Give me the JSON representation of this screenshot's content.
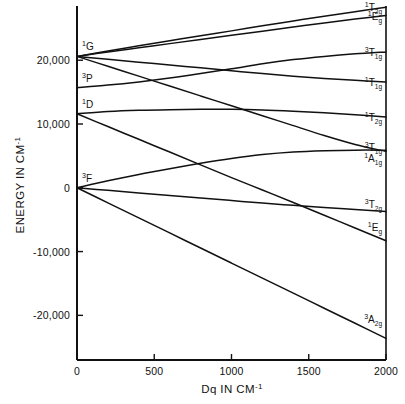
{
  "figure": {
    "kind": "energy-level-correlation-diagram",
    "background": "#ffffff",
    "line_color": "#111111"
  },
  "axes": {
    "x_title": "Dq IN CM",
    "x_title_sup": "-1",
    "y_title": "ENERGY IN CM",
    "y_title_sup": "-1",
    "x_ticks": [
      "0",
      "500",
      "1000",
      "1500",
      "2000"
    ],
    "y_ticks": [
      "20,000",
      "10,000",
      "0",
      "-10,000",
      "-20,000"
    ]
  },
  "free_ion_terms": [
    {
      "name": "free-ion-term-1G",
      "sup": "1",
      "letter": "G",
      "energy": 20600
    },
    {
      "name": "free-ion-term-3P",
      "sup": "3",
      "letter": "P",
      "energy": 15700
    },
    {
      "name": "free-ion-term-1D",
      "sup": "1",
      "letter": "D",
      "energy": 11600
    },
    {
      "name": "free-ion-term-3F",
      "sup": "3",
      "letter": "F",
      "energy": 0
    }
  ],
  "state_labels": [
    {
      "name": "state-label-1T2g-top",
      "sup": "1",
      "letter": "T",
      "sub": "2g",
      "energy": 28300
    },
    {
      "name": "state-label-1Eg-top",
      "sup": "1",
      "letter": "E",
      "sub": "g",
      "energy": 27000
    },
    {
      "name": "state-label-3T1g-P",
      "sup": "3",
      "letter": "T",
      "sub": "1g",
      "energy": 21300
    },
    {
      "name": "state-label-1T1g",
      "sup": "1",
      "letter": "T",
      "sub": "1g",
      "energy": 16600
    },
    {
      "name": "state-label-1T2g",
      "sup": "1",
      "letter": "T",
      "sub": "2g",
      "energy": 11100
    },
    {
      "name": "state-label-3T1g-F",
      "sup": "3",
      "letter": "T",
      "sub": "1g",
      "energy": 6400
    },
    {
      "name": "state-label-1A1g",
      "sup": "1",
      "letter": "A",
      "sub": "1g",
      "energy": 4600
    },
    {
      "name": "state-label-3T2g",
      "sup": "3",
      "letter": "T",
      "sub": "2g",
      "energy": -2600
    },
    {
      "name": "state-label-1Eg",
      "sup": "1",
      "letter": "E",
      "sub": "g",
      "energy": -6200
    },
    {
      "name": "state-label-3A2g",
      "sup": "3",
      "letter": "A",
      "sub": "2g",
      "energy": -20600
    }
  ],
  "chart_data": {
    "type": "line",
    "title": "",
    "xlabel": "Dq IN CM^-1",
    "ylabel": "ENERGY IN CM^-1",
    "xlim": [
      0,
      2000
    ],
    "ylim": [
      -27000,
      28500
    ],
    "grid": false,
    "legend": "right-of-plot-endpoint-labels",
    "x": [
      0,
      200,
      400,
      600,
      800,
      1000,
      1200,
      1400,
      1600,
      1800,
      2000
    ],
    "series": [
      {
        "name": "1T2g (from 1G)",
        "label": "¹T₂g",
        "values": [
          20600,
          21450,
          22250,
          23050,
          23850,
          24600,
          25400,
          26150,
          26900,
          27600,
          28300
        ]
      },
      {
        "name": "1Eg (from 1G)",
        "label": "¹Eg",
        "values": [
          20600,
          21300,
          21950,
          22600,
          23250,
          23900,
          24550,
          25200,
          25850,
          26450,
          27000
        ]
      },
      {
        "name": "3T1g (from 3P)",
        "label": "³T₁g(P)",
        "values": [
          15700,
          16100,
          16600,
          17200,
          17900,
          18650,
          19450,
          20100,
          20600,
          21000,
          21300
        ]
      },
      {
        "name": "1T1g (from 1G)",
        "label": "¹T₁g",
        "values": [
          20600,
          20150,
          19700,
          19250,
          18800,
          18350,
          17900,
          17500,
          17150,
          16850,
          16600
        ]
      },
      {
        "name": "1T2g (from 1D)",
        "label": "¹T₂g",
        "values": [
          11600,
          11950,
          12150,
          12250,
          12300,
          12300,
          12200,
          12000,
          11750,
          11450,
          11100
        ]
      },
      {
        "name": "3T1g (from 3F)",
        "label": "³T₁g(F)",
        "values": [
          0,
          1100,
          2100,
          3000,
          3850,
          4600,
          5200,
          5600,
          5800,
          5900,
          5900
        ]
      },
      {
        "name": "1A1g (from 1G)",
        "label": "¹A₁g",
        "values": [
          20600,
          19050,
          17500,
          15950,
          14400,
          12850,
          11300,
          9750,
          8200,
          6800,
          5700
        ]
      },
      {
        "name": "3T2g (from 3F)",
        "label": "³T₂g",
        "values": [
          0,
          -400,
          -800,
          -1200,
          -1600,
          -2000,
          -2400,
          -2750,
          -3100,
          -3400,
          -3700
        ]
      },
      {
        "name": "1Eg (from 1D)",
        "label": "¹Eg",
        "values": [
          11600,
          9600,
          7600,
          5600,
          3600,
          1600,
          -350,
          -2300,
          -4300,
          -6300,
          -8300
        ]
      },
      {
        "name": "3A2g (from 3F)",
        "label": "³A₂g",
        "values": [
          0,
          -2360,
          -4720,
          -7080,
          -9440,
          -11800,
          -14160,
          -16520,
          -18880,
          -21240,
          -23600
        ]
      }
    ]
  }
}
